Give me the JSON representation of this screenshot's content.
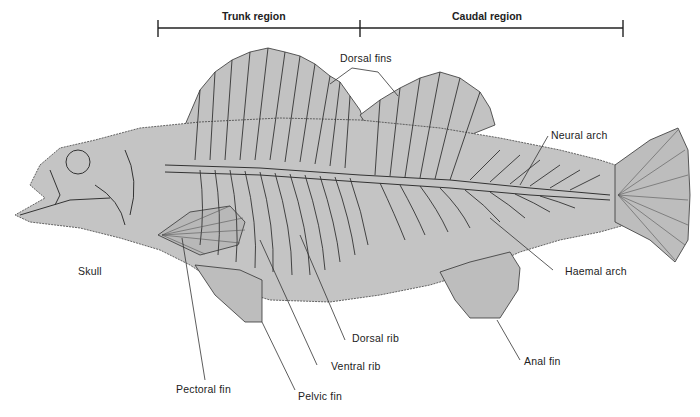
{
  "diagram": {
    "colors": {
      "body_fill": "#c4c4c4",
      "outline": "#333333",
      "fin_fill": "#bdbdbd",
      "text": "#222222",
      "background": "#ffffff"
    },
    "regions": [
      {
        "label": "Trunk region",
        "x_start": 158,
        "x_end": 360
      },
      {
        "label": "Caudal region",
        "x_start": 360,
        "x_end": 623
      }
    ],
    "labels": {
      "dorsal_fins": "Dorsal fins",
      "neural_arch": "Neural arch",
      "haemal_arch": "Haemal arch",
      "skull": "Skull",
      "dorsal_rib": "Dorsal rib",
      "ventral_rib": "Ventral rib",
      "pectoral_fin": "Pectoral fin",
      "pelvic_fin": "Pelvic fin",
      "anal_fin": "Anal fin"
    }
  }
}
